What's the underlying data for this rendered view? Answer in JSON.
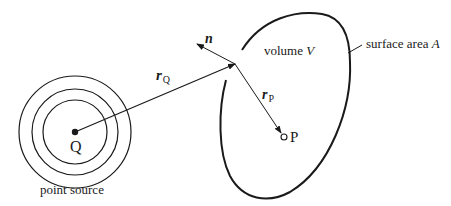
{
  "diagram": {
    "title": "",
    "colors": {
      "stroke": "#1a1a1a",
      "background": "#ffffff"
    },
    "source": {
      "label": "Q",
      "caption": "point source",
      "rings": 3
    },
    "vectors": {
      "rQ": {
        "symbol": "r",
        "subscript": "Q"
      },
      "rP": {
        "symbol": "r",
        "subscript": "P"
      },
      "normal": {
        "symbol": "n"
      }
    },
    "region": {
      "volume_prefix": "volume",
      "volume_symbol": "V",
      "surface_prefix": "surface area",
      "surface_symbol": "A"
    },
    "point": {
      "label": "P"
    }
  }
}
